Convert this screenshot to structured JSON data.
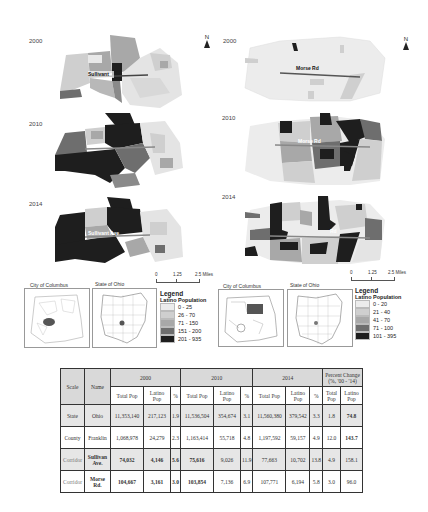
{
  "left_panel": {
    "corridor": "Sullivant Ave.",
    "maps": [
      {
        "year": "2000",
        "road_label": "Sullivant"
      },
      {
        "year": "2010",
        "road_label": "Sullivant Ave"
      },
      {
        "year": "2014",
        "road_label": "Sullivant Ave"
      }
    ],
    "north_label": "N",
    "scale": {
      "ticks": [
        "0",
        "1.25",
        "2.5 Miles"
      ]
    },
    "insets": {
      "city_title": "City of Columbus",
      "state_title": "State of Ohio"
    },
    "legend": {
      "title": "Legend",
      "subtitle": "Latino Population",
      "classes": [
        {
          "label": "0 - 25",
          "color": "#ececec"
        },
        {
          "label": "26 - 70",
          "color": "#cfcfcf"
        },
        {
          "label": "71 - 150",
          "color": "#a8a8a8"
        },
        {
          "label": "151 - 200",
          "color": "#6e6e6e"
        },
        {
          "label": "201 - 935",
          "color": "#1e1e1e"
        }
      ]
    }
  },
  "right_panel": {
    "corridor": "Morse Rd.",
    "maps": [
      {
        "year": "2000",
        "road_label": "Morse Rd"
      },
      {
        "year": "2010",
        "road_label": "Morse Rd"
      },
      {
        "year": "2014",
        "road_label": "Rd"
      }
    ],
    "north_label": "N",
    "scale": {
      "ticks": [
        "0",
        "1.25",
        "2.5 Miles"
      ]
    },
    "insets": {
      "city_title": "City of Columbus",
      "state_title": "State of Ohio"
    },
    "legend": {
      "title": "Legend",
      "subtitle": "Latino Population",
      "classes": [
        {
          "label": "0 - 20",
          "color": "#ececec"
        },
        {
          "label": "21 - 40",
          "color": "#cfcfcf"
        },
        {
          "label": "41 - 70",
          "color": "#a8a8a8"
        },
        {
          "label": "71 - 100",
          "color": "#6e6e6e"
        },
        {
          "label": "101 - 395",
          "color": "#1e1e1e"
        }
      ]
    }
  },
  "table": {
    "headers": {
      "scale": "Scale",
      "name": "Name",
      "y2000": "2000",
      "y2010": "2010",
      "y2014": "2014",
      "pct_change_line1": "Percent Change",
      "pct_change_line2": "(%, '00 - '14)",
      "total_pop": "Total Pop",
      "latino_pop": "Latino Pop",
      "pct": "%"
    },
    "rows": [
      {
        "scale": "State",
        "name": "Ohio",
        "tp2000": "11,353,140",
        "lp2000": "217,123",
        "p2000": "1.9",
        "tp2010": "11,536,504",
        "lp2010": "354,674",
        "p2010": "3.1",
        "tp2014": "11,560,380",
        "lp2014": "379,542",
        "p2014": "3.3",
        "chg_total": "1.8",
        "chg_latino": "74.8"
      },
      {
        "scale": "County",
        "name": "Franklin",
        "tp2000": "1,068,978",
        "lp2000": "24,279",
        "p2000": "2.3",
        "tp2010": "1,163,414",
        "lp2010": "55,718",
        "p2010": "4.8",
        "tp2014": "1,197,592",
        "lp2014": "59,157",
        "p2014": "4.9",
        "chg_total": "12.0",
        "chg_latino": "143.7"
      },
      {
        "scale": "Corridor",
        "name": "Sullivan Ave.",
        "tp2000": "74,032",
        "lp2000": "4,146",
        "p2000": "5.6",
        "tp2010": "75,616",
        "lp2010": "9,026",
        "p2010": "11.9",
        "tp2014": "77,663",
        "lp2014": "10,702",
        "p2014": "13.8",
        "chg_total": "4.9",
        "chg_latino": "158.1"
      },
      {
        "scale": "Corridor",
        "name": "Morse Rd.",
        "tp2000": "104,667",
        "lp2000": "3,161",
        "p2000": "3.0",
        "tp2010": "103,854",
        "lp2010": "7,136",
        "p2010": "6.9",
        "tp2014": "107,771",
        "lp2014": "6,194",
        "p2014": "5.8",
        "chg_total": "3.0",
        "chg_latino": "96.0"
      }
    ]
  }
}
